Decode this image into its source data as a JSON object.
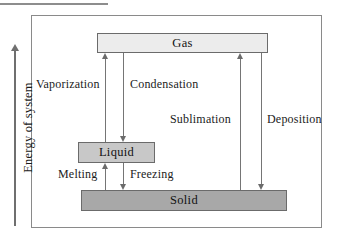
{
  "diagram": {
    "title_axis": "Energy of system",
    "phases": [
      {
        "id": "gas",
        "label": "Gas"
      },
      {
        "id": "liquid",
        "label": "Liquid"
      },
      {
        "id": "solid",
        "label": "Solid"
      }
    ],
    "transitions": [
      {
        "id": "vaporization",
        "label": "Vaporization",
        "from": "Liquid",
        "to": "Gas",
        "direction": "up"
      },
      {
        "id": "condensation",
        "label": "Condensation",
        "from": "Gas",
        "to": "Liquid",
        "direction": "down"
      },
      {
        "id": "sublimation",
        "label": "Sublimation",
        "from": "Solid",
        "to": "Gas",
        "direction": "up"
      },
      {
        "id": "deposition",
        "label": "Deposition",
        "from": "Gas",
        "to": "Solid",
        "direction": "down"
      },
      {
        "id": "melting",
        "label": "Melting",
        "from": "Solid",
        "to": "Liquid",
        "direction": "up"
      },
      {
        "id": "freezing",
        "label": "Freezing",
        "from": "Liquid",
        "to": "Solid",
        "direction": "down"
      }
    ],
    "colors": {
      "gas_fill": "#ececec",
      "liquid_fill": "#c8c8c8",
      "solid_fill": "#a8a8a8",
      "border": "#8a8a8a",
      "arrow": "#6b6b6b",
      "text": "#121212"
    }
  }
}
